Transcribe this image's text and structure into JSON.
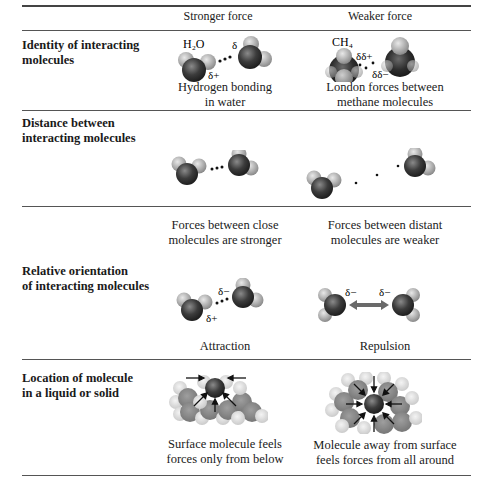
{
  "table": {
    "columns": [
      "",
      "Stronger force",
      "Weaker force"
    ],
    "rows": [
      {
        "label_lines": [
          "Identity of interacting",
          "molecules"
        ],
        "stronger": {
          "caption_lines": [
            "Hydrogen bonding",
            "in water"
          ],
          "annotations": {
            "formula": "H₂O",
            "delta_minus": "δ",
            "delta_plus": "δ+"
          }
        },
        "weaker": {
          "caption_lines": [
            "London forces between",
            "methane molecules"
          ],
          "annotations": {
            "formula": "CH₄",
            "delta_plus": "δδ+",
            "delta_minus": "δδ−"
          }
        }
      },
      {
        "label_lines": [
          "Distance between",
          "interacting molecules"
        ],
        "stronger": {
          "caption_lines": [
            "Forces between close",
            "molecules are stronger"
          ]
        },
        "weaker": {
          "caption_lines": [
            "Forces between distant",
            "molecules are weaker"
          ]
        }
      },
      {
        "label_lines": [
          "Relative orientation",
          "of interacting molecules"
        ],
        "stronger": {
          "caption_lines": [
            "Attraction"
          ],
          "annotations": {
            "delta_minus": "δ−",
            "delta_plus": "δ+"
          }
        },
        "weaker": {
          "caption_lines": [
            "Repulsion"
          ],
          "annotations": {
            "delta_left": "δ−",
            "delta_right": "δ−"
          }
        }
      },
      {
        "label_lines": [
          "Location of molecule",
          "in a liquid or solid"
        ],
        "stronger": {
          "caption_lines": [
            "Surface molecule feels",
            "forces only from below"
          ]
        },
        "weaker": {
          "caption_lines": [
            "Molecule away from surface",
            "feels forces from all around"
          ]
        }
      }
    ]
  },
  "colors": {
    "oxygen": "#3a3a3a",
    "hydrogen": "#b8b8b8",
    "carbon": "#404040",
    "rule": "#555555",
    "repulsion_arrow": "#6a6a6a"
  }
}
